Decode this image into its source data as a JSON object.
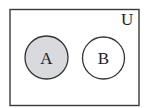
{
  "diagram": {
    "type": "venn",
    "universe_label": "U",
    "sets": [
      {
        "label": "A",
        "shaded": true,
        "fill": "#d9dadd"
      },
      {
        "label": "B",
        "shaded": false,
        "fill": "#ffffff"
      }
    ],
    "colors": {
      "stroke": "#333333",
      "shade": "#d9dadd",
      "background": "#ffffff"
    }
  }
}
